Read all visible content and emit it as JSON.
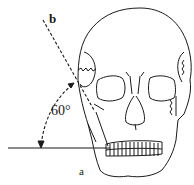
{
  "diagram": {
    "labels": {
      "line_b": "b",
      "line_a": "a",
      "angle": "60°"
    },
    "colors": {
      "stroke": "#1a1a1a",
      "background": "#ffffff"
    }
  }
}
